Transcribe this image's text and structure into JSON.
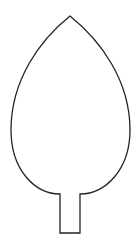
{
  "figure": {
    "stroke_color": "#222222",
    "background_color": "#ffffff",
    "stroke_width": 1.3
  },
  "shape": {
    "apex": [
      70,
      16
    ],
    "left_extreme": [
      11,
      130
    ],
    "right_extreme": [
      130,
      130
    ],
    "base_left": [
      60,
      194
    ],
    "base_right": [
      80,
      194
    ],
    "stem": {
      "left_x": 60,
      "right_x": 80,
      "top_y": 194,
      "bottom_y": 233
    }
  }
}
